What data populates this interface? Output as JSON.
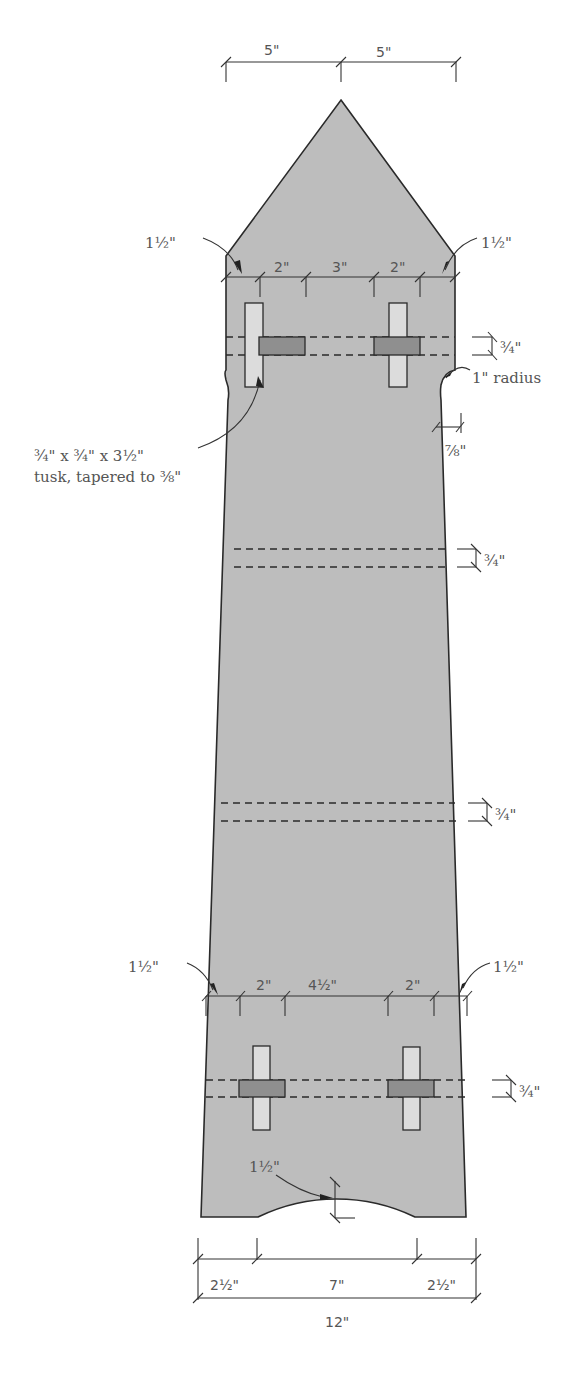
{
  "dimensions": {
    "top_left_half": "5\"",
    "top_right_half": "5\"",
    "upper_chamfer_left": "1½\"",
    "upper_chamfer_right": "1½\"",
    "upper_spacing_left": "2\"",
    "upper_spacing_mid": "3\"",
    "upper_spacing_right": "2\"",
    "upper_stretcher_height": "¾\"",
    "neck_radius": "1\" radius",
    "neck_inset": "⅞\"",
    "tusk_callout_line1": "¾\" x ¾\" x 3½\"",
    "tusk_callout_line2": "tusk, tapered to ⅜\"",
    "middle_stretcher_1_height": "¾\"",
    "middle_stretcher_2_height": "¾\"",
    "lower_chamfer_left": "1½\"",
    "lower_chamfer_right": "1½\"",
    "lower_spacing_left": "2\"",
    "lower_spacing_mid": "4½\"",
    "lower_spacing_right": "2\"",
    "lower_stretcher_height": "¾\"",
    "arch_height": "1½\"",
    "bottom_left": "2½\"",
    "bottom_mid": "7\"",
    "bottom_right": "2½\"",
    "bottom_total": "12\""
  },
  "colors": {
    "part_fill": "#bdbdbd",
    "mortise_fill": "#dcdcdc",
    "tusk_fill": "#8f8f8f",
    "line": "#2a2a2a"
  }
}
